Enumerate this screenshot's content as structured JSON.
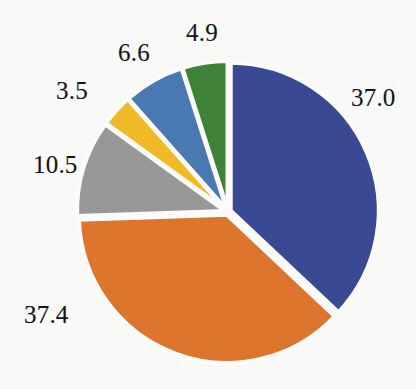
{
  "chart_data": {
    "type": "pie",
    "title": "",
    "subtitle": "",
    "xlabel": "",
    "ylabel": "",
    "legend_position": "none",
    "grid": false,
    "start_angle_deg": 0,
    "direction": "clockwise",
    "exploded": true,
    "background_color": "#fdfdfc",
    "gap_color": "#ffffff",
    "label_color": "#15161a",
    "categories": [
      "37.0",
      "37.4",
      "10.5",
      "3.5",
      "6.6",
      "4.9"
    ],
    "values": [
      37.0,
      37.4,
      10.5,
      3.5,
      6.6,
      4.9
    ],
    "total": 99.9,
    "colors": [
      "#3a4a96",
      "#e2762b",
      "#9a9a9a",
      "#f5bc25",
      "#4a7ab5",
      "#3f8438"
    ],
    "slices": [
      {
        "label": "37.0",
        "value": 37.0,
        "color": "#3a4a96",
        "color_name": "navy-blue",
        "start_deg": 0.0,
        "end_deg": 133.3,
        "label_x": 351,
        "label_y": 85
      },
      {
        "label": "37.4",
        "value": 37.4,
        "color": "#e2762b",
        "color_name": "orange",
        "start_deg": 133.3,
        "end_deg": 268.1,
        "label_x": 24,
        "label_y": 302
      },
      {
        "label": "10.5",
        "value": 10.5,
        "color": "#9a9a9a",
        "color_name": "gray",
        "start_deg": 268.1,
        "end_deg": 305.9,
        "label_x": 33,
        "label_y": 152
      },
      {
        "label": "3.5",
        "value": 3.5,
        "color": "#f5bc25",
        "color_name": "amber-yellow",
        "start_deg": 305.9,
        "end_deg": 318.5,
        "label_x": 56,
        "label_y": 78
      },
      {
        "label": "6.6",
        "value": 6.6,
        "color": "#4a7ab5",
        "color_name": "steel-blue",
        "start_deg": 318.5,
        "end_deg": 342.3,
        "label_x": 118,
        "label_y": 40
      },
      {
        "label": "4.9",
        "value": 4.9,
        "color": "#3f8438",
        "color_name": "green",
        "start_deg": 342.3,
        "end_deg": 360.0,
        "label_x": 186,
        "label_y": 20
      }
    ],
    "geometry": {
      "center_x": 228,
      "center_y": 212,
      "radius": 148,
      "explode_offset": 3
    }
  }
}
